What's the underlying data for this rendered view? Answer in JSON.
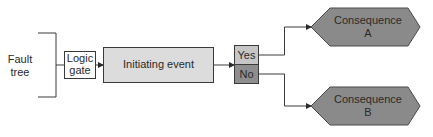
{
  "diagram": {
    "type": "event-tree-bowtie",
    "fault_tree": {
      "label_line1": "Fault",
      "label_line2": "tree"
    },
    "logic_gate": {
      "label_line1": "Logic",
      "label_line2": "gate"
    },
    "initiating_event": {
      "label": "Initiating event"
    },
    "branch": {
      "yes_label": "Yes",
      "no_label": "No"
    },
    "consequences": [
      {
        "label_line1": "Consequence",
        "label_line2": "A"
      },
      {
        "label_line1": "Consequence",
        "label_line2": "B"
      }
    ],
    "colors": {
      "line": "#3a3a3a",
      "initiating_fill": "#dcdcdc",
      "yes_fill": "#c6c6c6",
      "no_fill": "#8e8e8e",
      "consequence_fill": "#8a8a8a",
      "gate_fill": "#ffffff"
    }
  }
}
